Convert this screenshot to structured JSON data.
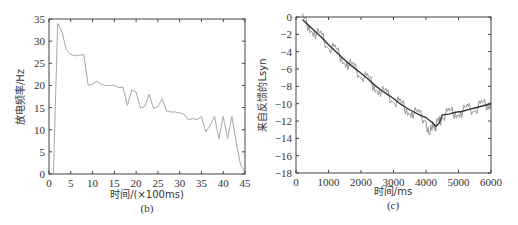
{
  "chart_data": [
    {
      "type": "line",
      "panel": "(b)",
      "title": "",
      "xlabel": "时间/(×100ms)",
      "ylabel": "放电频率/Hz",
      "xlim": [
        0,
        45
      ],
      "ylim": [
        0,
        35
      ],
      "xticks": [
        0,
        5,
        10,
        15,
        20,
        25,
        30,
        35,
        40,
        45
      ],
      "yticks": [
        0,
        5,
        10,
        15,
        20,
        25,
        30,
        35
      ],
      "grid": false,
      "series": [
        {
          "name": "放电频率",
          "color": "#a8a8a8",
          "x": [
            1,
            2,
            3,
            4,
            5,
            6,
            7,
            8,
            9,
            10,
            11,
            12,
            13,
            14,
            15,
            16,
            17,
            18,
            19,
            20,
            21,
            22,
            23,
            24,
            25,
            26,
            27,
            28,
            29,
            30,
            31,
            32,
            33,
            34,
            35,
            36,
            37,
            38,
            39,
            40,
            41,
            42,
            43,
            44,
            45
          ],
          "values": [
            0,
            34,
            32,
            28,
            27,
            26.7,
            26.8,
            27,
            20,
            20.3,
            21,
            20.2,
            20,
            20,
            20,
            19.5,
            19.6,
            15.5,
            19,
            18.5,
            14.8,
            15.3,
            18,
            14.8,
            15.2,
            17,
            14.2,
            14,
            14,
            13.8,
            13.5,
            12.2,
            12.5,
            12.3,
            13,
            9.5,
            11,
            13,
            8,
            13,
            8,
            13,
            7,
            2,
            0.5
          ]
        }
      ]
    },
    {
      "type": "line",
      "panel": "(c)",
      "title": "",
      "xlabel": "时间/ms",
      "ylabel": "来自反馈的Lsyn",
      "xlim": [
        0,
        6000
      ],
      "ylim": [
        -18,
        0
      ],
      "xticks": [
        0,
        1000,
        2000,
        3000,
        4000,
        5000,
        6000
      ],
      "yticks": [
        0,
        -2,
        -4,
        -6,
        -8,
        -10,
        -12,
        -14,
        -16,
        -18
      ],
      "grid": false,
      "series": [
        {
          "name": "raw (noisy)",
          "color": "#9a9a9a",
          "x": [
            200,
            400,
            600,
            800,
            1000,
            1200,
            1400,
            1600,
            1800,
            2000,
            2200,
            2400,
            2600,
            2800,
            3000,
            3200,
            3400,
            3600,
            3800,
            4000,
            4100,
            4200,
            4300,
            4400,
            4500,
            4700,
            4900,
            5100,
            5300,
            5500,
            5700,
            5900,
            6000
          ],
          "values": [
            -0.3,
            -1.0,
            -1.8,
            -2.4,
            -3.3,
            -3.9,
            -4.6,
            -5.4,
            -6.0,
            -6.6,
            -7.2,
            -7.9,
            -8.5,
            -9.0,
            -9.5,
            -10.1,
            -10.6,
            -11.0,
            -11.4,
            -11.7,
            -14.3,
            -12.0,
            -12.5,
            -12.3,
            -11.3,
            -11.2,
            -11.0,
            -10.9,
            -10.7,
            -10.5,
            -10.3,
            -10.0,
            -9.8
          ]
        },
        {
          "name": "smoothed",
          "color": "#333333",
          "x": [
            200,
            400,
            600,
            800,
            1000,
            1200,
            1400,
            1600,
            1800,
            2000,
            2200,
            2400,
            2600,
            2800,
            3000,
            3200,
            3400,
            3600,
            3800,
            4000,
            4200,
            4300,
            4400,
            4500,
            4700,
            4900,
            5100,
            5300,
            5500,
            5700,
            5900,
            6000
          ],
          "values": [
            -0.3,
            -1.0,
            -1.7,
            -2.4,
            -3.2,
            -3.9,
            -4.6,
            -5.3,
            -5.9,
            -6.5,
            -7.1,
            -7.8,
            -8.4,
            -8.9,
            -9.4,
            -10.0,
            -10.5,
            -10.9,
            -11.3,
            -11.6,
            -12.2,
            -12.6,
            -12.3,
            -11.3,
            -11.2,
            -11.0,
            -10.9,
            -10.7,
            -10.5,
            -10.3,
            -10.1,
            -10.0
          ]
        }
      ]
    }
  ],
  "panels": {
    "b": {
      "xlabel": "时间/(×100ms)",
      "ylabel": "放电频率/Hz",
      "caption": "(b)"
    },
    "c": {
      "xlabel": "时间/ms",
      "ylabel": "来自反馈的Lsyn",
      "caption": "(c)"
    }
  }
}
